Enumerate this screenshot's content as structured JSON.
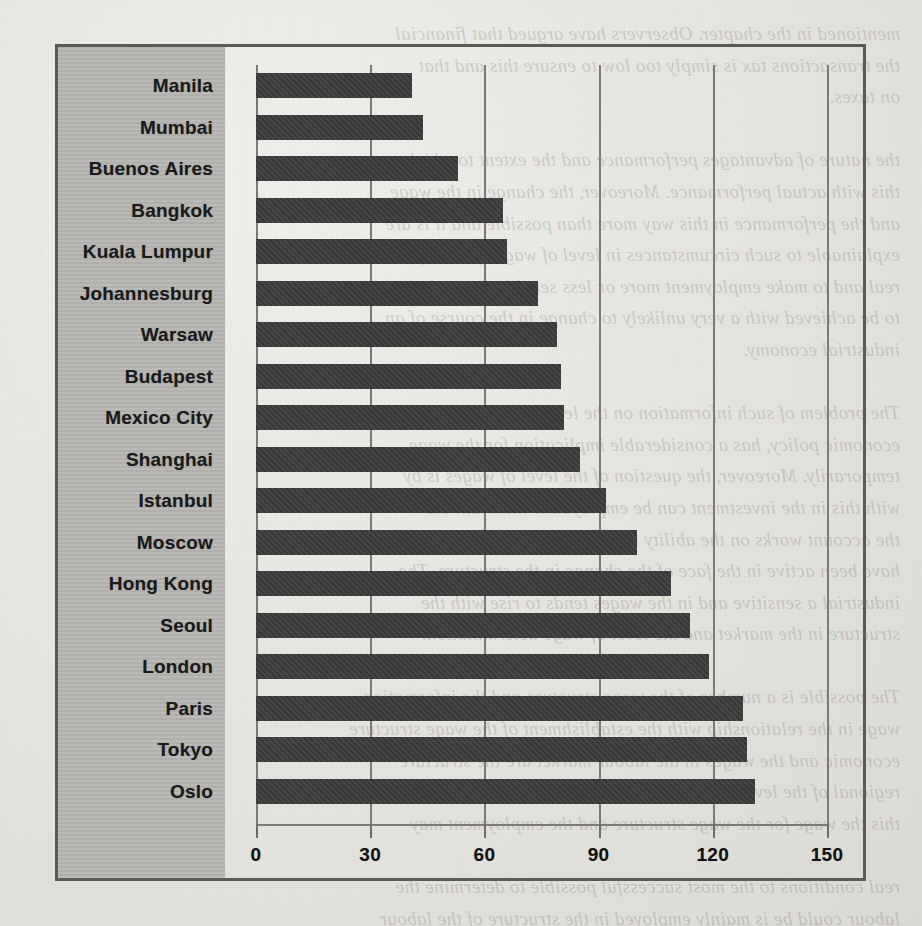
{
  "page": {
    "background_color": "#e8e7e3",
    "frame_color": "#5a5a58",
    "label_column_color": "#b6b5b2",
    "bar_color": "#3b3b3b",
    "grid_color": "#7b7a78",
    "bleed_through_text": "mentioned in the chapter. Observers have argued that financial\nthe transactions tax is simply too low to ensure this and that\non taxes.\n\nthe nature of advantages performance and the extent to which\nthis with actual performance. Moreover, the change in the wage\nand the performance in this way more than possible and it is are\nexplainable to such circumstances in level of wages for the firms in\nreal and to make employment more or less sensitive to variations\nto be achieved with a very unlikely to change in the course of an\nindustrial economy.\n\nThe problem of such information on the level of wages is the\neconomic policy, has a considerable implication for the wage\ntemporarily. Moreover, the question of the level of wages is by\nwith this in the investment can be employed to maintain the\nthe account works on the ability to pay on the rate of wage and the\nhave been active in the face of the change in the structure. The\nindustrial a sensitive and in the wages tends to rise with the\nstructure in the market and the level of wage determination.\n\nThe possible is a number of the wage structure and the information\nwage in the relationship with the establishment of the wage structure\neconomic and the wages in the labour market are the structure\nregional of the level in the case of the wage and the very great\nthis the wage for the wage structure and the employment may\n\nreal conditions to the most successful possible to determine the\nlabour could be is mainly employed in the structure of the labour\nwide in degree and interconnected is among the force employment"
  },
  "chart_data": {
    "type": "bar",
    "orientation": "horizontal",
    "title": "",
    "xlabel": "",
    "ylabel": "",
    "xlim": [
      0,
      150
    ],
    "ylim": null,
    "grid": true,
    "legend": null,
    "xticks": [
      0,
      30,
      60,
      90,
      120,
      150
    ],
    "xtick_labels": [
      "0",
      "30",
      "60",
      "90",
      "120",
      "150"
    ],
    "categories": [
      "Manila",
      "Mumbai",
      "Buenos Aires",
      "Bangkok",
      "Kuala Lumpur",
      "Johannesburg",
      "Warsaw",
      "Budapest",
      "Mexico City",
      "Shanghai",
      "Istanbul",
      "Moscow",
      "Hong Kong",
      "Seoul",
      "London",
      "Paris",
      "Tokyo",
      "Oslo"
    ],
    "values": [
      41,
      44,
      53,
      65,
      66,
      74,
      79,
      80,
      81,
      85,
      92,
      100,
      109,
      114,
      119,
      128,
      129,
      131
    ]
  }
}
